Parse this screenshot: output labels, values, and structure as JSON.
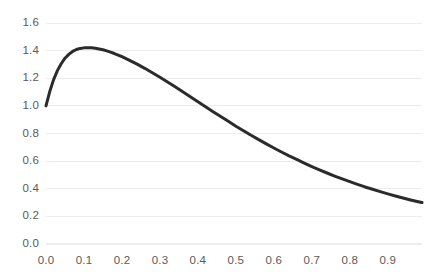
{
  "chart_data": {
    "type": "line",
    "title": "",
    "subtitle": "",
    "xlabel": "",
    "ylabel": "",
    "xlim": [
      0.0,
      0.99
    ],
    "ylim": [
      0.0,
      1.6
    ],
    "grid": true,
    "grid_axis": "y",
    "legend": null,
    "legend_position": "none",
    "line_color": "#2b2b2b",
    "line_width": 3,
    "grid_color": "#ededed",
    "tick_label_color": "#5a5a5a",
    "background_color": "#ffffff",
    "x_tick_labels": [
      "0.0",
      "0.1",
      "0.2",
      "0.3",
      "0.4",
      "0.5",
      "0.6",
      "0.7",
      "0.8",
      "0.9"
    ],
    "x_tick_values": [
      0.0,
      0.1,
      0.2,
      0.3,
      0.4,
      0.5,
      0.6,
      0.7,
      0.8,
      0.9
    ],
    "y_tick_labels": [
      "0.0",
      "0.2",
      "0.4",
      "0.6",
      "0.8",
      "1.0",
      "1.2",
      "1.4",
      "1.6"
    ],
    "y_tick_values": [
      0.0,
      0.2,
      0.4,
      0.6,
      0.8,
      1.0,
      1.2,
      1.4,
      1.6
    ],
    "series": [
      {
        "name": "curve",
        "x": [
          0.0,
          0.01,
          0.02,
          0.03,
          0.04,
          0.05,
          0.06,
          0.07,
          0.08,
          0.09,
          0.1,
          0.11,
          0.12,
          0.13,
          0.14,
          0.15,
          0.16,
          0.17,
          0.18,
          0.19,
          0.2,
          0.22,
          0.24,
          0.26,
          0.28,
          0.3,
          0.32,
          0.34,
          0.36,
          0.38,
          0.4,
          0.42,
          0.44,
          0.46,
          0.48,
          0.5,
          0.52,
          0.54,
          0.56,
          0.58,
          0.6,
          0.62,
          0.64,
          0.66,
          0.68,
          0.7,
          0.72,
          0.74,
          0.76,
          0.78,
          0.8,
          0.82,
          0.84,
          0.86,
          0.88,
          0.9,
          0.92,
          0.94,
          0.96,
          0.98,
          0.99
        ],
        "y": [
          1.0,
          1.105,
          1.19,
          1.255,
          1.305,
          1.345,
          1.373,
          1.394,
          1.408,
          1.416,
          1.42,
          1.421,
          1.42,
          1.417,
          1.412,
          1.406,
          1.398,
          1.389,
          1.379,
          1.368,
          1.356,
          1.33,
          1.302,
          1.272,
          1.24,
          1.207,
          1.173,
          1.138,
          1.102,
          1.066,
          1.03,
          0.994,
          0.958,
          0.923,
          0.888,
          0.853,
          0.82,
          0.787,
          0.756,
          0.725,
          0.695,
          0.666,
          0.638,
          0.612,
          0.586,
          0.561,
          0.537,
          0.514,
          0.492,
          0.471,
          0.451,
          0.432,
          0.413,
          0.396,
          0.379,
          0.363,
          0.348,
          0.333,
          0.319,
          0.306,
          0.3
        ]
      }
    ],
    "annotations": [],
    "peak": {
      "x": 0.12,
      "y": 1.42
    },
    "start_point": {
      "x": 0.0,
      "y": 1.0
    },
    "end_point": {
      "x": 0.99,
      "y": 0.2
    }
  },
  "layout": {
    "plot_left_px": 46,
    "plot_right_px": 422,
    "plot_top_px": 23,
    "plot_bottom_px": 244
  }
}
